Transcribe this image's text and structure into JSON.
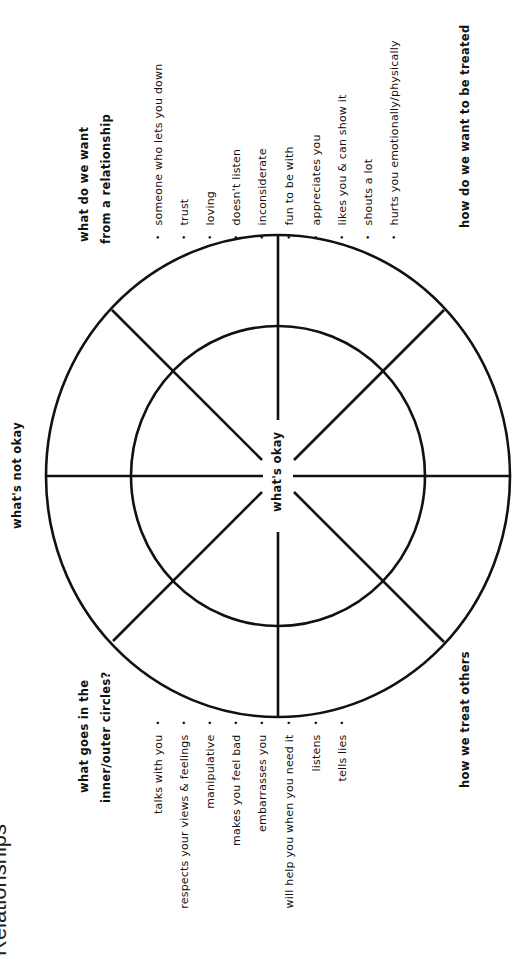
{
  "title": "Relationships",
  "wheel": {
    "center_label": "what's okay",
    "outer_label": "what's not okay"
  },
  "labels": {
    "what_want": [
      "what do we want",
      "from a relationship"
    ],
    "how_treated": "how do we want to be treated",
    "how_treat_others": "how we treat others",
    "what_goes": [
      "what goes in the",
      "inner/outer circles?"
    ]
  },
  "right_list": [
    "someone who lets you down",
    "trust",
    "loving",
    "doesn't listen",
    "inconsiderate",
    "fun to be with",
    "appreciates you",
    "likes you & can show it",
    "shouts a lot",
    "hurts you emotionally/physically"
  ],
  "left_list": [
    "talks with you",
    "respects your views & feelings",
    "manipulative",
    "makes you feel bad",
    "embarrasses you",
    "will help you when you need it",
    "listens",
    "tells lies"
  ],
  "colors": {
    "ink": "#111111",
    "background": "#ffffff"
  }
}
